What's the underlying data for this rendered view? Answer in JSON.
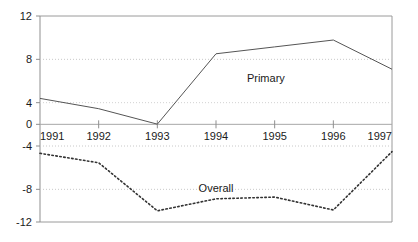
{
  "chart_data": {
    "type": "line",
    "title": "",
    "subtitle": "",
    "xlabel": "",
    "ylabel": "",
    "x": [
      1991,
      1992,
      1993,
      1994,
      1995,
      1996,
      1997
    ],
    "xlim": [
      1991,
      1997
    ],
    "ylim": [
      -12,
      12
    ],
    "ytick_values": [
      12,
      8,
      4,
      0,
      -4,
      -8,
      -12
    ],
    "ytick_labels": [
      "12",
      "8",
      "4",
      "0",
      "-4",
      "-8",
      "-12"
    ],
    "xtick_labels": [
      "1991",
      "1992",
      "1993",
      "1994",
      "1995",
      "1996",
      "1997"
    ],
    "grid": "horizontal-dotted",
    "legend": "inline-annotations",
    "series": [
      {
        "name": "Primary",
        "style": "solid",
        "color": "#555555",
        "values": [
          2.4,
          1.2,
          -0.6,
          7.6,
          8.4,
          9.2,
          5.8
        ],
        "label_x": 1994.85,
        "label_y": 4.3
      },
      {
        "name": "Overall",
        "style": "dotted",
        "color": "#333333",
        "values": [
          -4.0,
          -5.1,
          -10.7,
          -9.3,
          -9.1,
          -10.6,
          -3.8
        ],
        "label_x": 1994.0,
        "label_y": -8.5
      }
    ],
    "axis_color": "#808080",
    "gridline_color": "#c8c8c8",
    "zero_line_color": "#a0a0a0",
    "background": "#ffffff"
  }
}
